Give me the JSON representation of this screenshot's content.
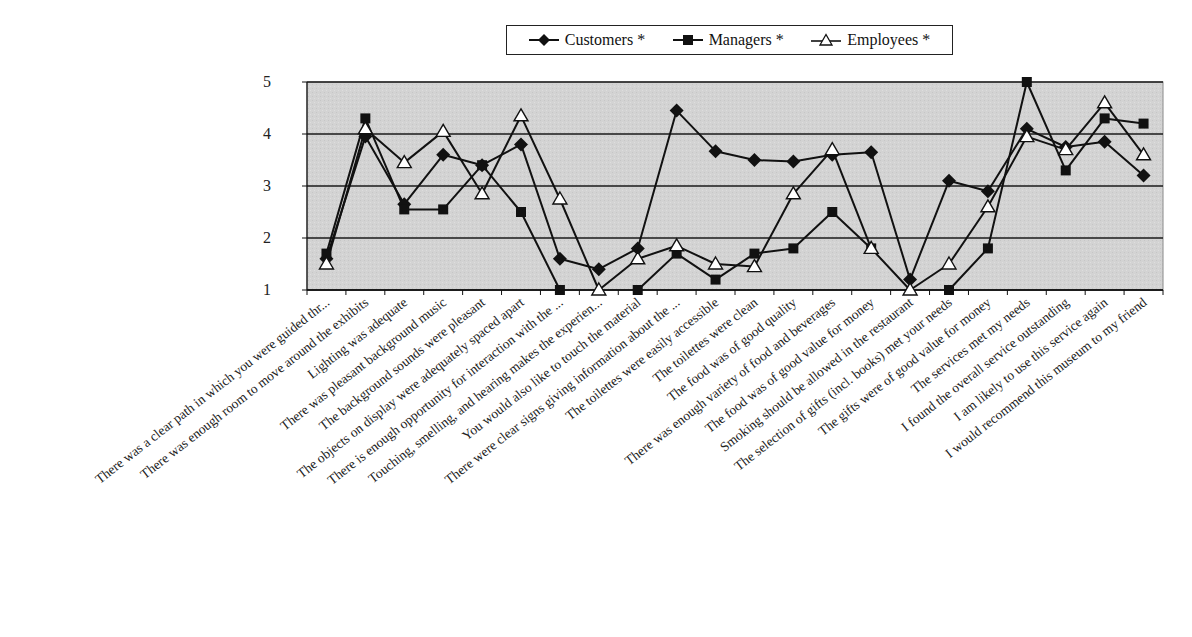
{
  "chart_data": {
    "type": "line",
    "title": "",
    "xlabel": "",
    "ylabel": "",
    "ylim": [
      1,
      5
    ],
    "yticks": [
      1,
      2,
      3,
      4,
      5
    ],
    "grid": true,
    "legend_position": "top",
    "categories": [
      "There was a clear path in which you were guided thr...",
      "There was enough room to move around the exhibits",
      "Lighting was adequate",
      "There was pleasant background music",
      "The background sounds were pleasant",
      "The objects on display were adequately spaced apart",
      "There is enough opportunity for interaction with the ...",
      "Touching, smelling, and hearing makes the experien...",
      "You would also like to touch the material",
      "There were clear signs giving information about the ...",
      "The toilettes were easily accessible",
      "The toilettes were clean",
      "The food was of good quality",
      "There was enough variety of food and beverages",
      "The food was of good value for money",
      "Smoking should be allowed in the restaurant",
      "The selection of gifts (incl. books) met your needs",
      "The gifts were of good value for money",
      "The services met my needs",
      "I found the overall service outstanding",
      "I am likely to use this service again",
      "I would recommend this museum to my friend"
    ],
    "series": [
      {
        "name": "Customers *",
        "marker": "diamond",
        "values": [
          1.6,
          3.95,
          2.65,
          3.6,
          3.4,
          3.8,
          1.6,
          1.4,
          1.8,
          4.45,
          3.67,
          3.5,
          3.47,
          3.6,
          3.65,
          1.2,
          3.1,
          2.9,
          4.1,
          3.75,
          3.85,
          3.2
        ]
      },
      {
        "name": "Managers *",
        "marker": "square",
        "values": [
          1.7,
          4.3,
          2.55,
          2.55,
          3.4,
          2.5,
          1.0,
          null,
          1.0,
          1.7,
          1.2,
          1.7,
          1.8,
          2.5,
          1.8,
          null,
          1.0,
          1.8,
          5.0,
          3.3,
          4.3,
          4.2
        ]
      },
      {
        "name": "Employees *",
        "marker": "triangle",
        "values": [
          1.5,
          4.1,
          3.45,
          4.05,
          2.85,
          4.35,
          2.75,
          1.0,
          1.6,
          1.85,
          1.5,
          1.45,
          2.85,
          3.7,
          1.8,
          1.0,
          1.5,
          2.6,
          3.95,
          3.7,
          4.6,
          3.6
        ]
      }
    ]
  },
  "legend": {
    "items": [
      {
        "label": "Customers *",
        "marker": "diamond"
      },
      {
        "label": "Managers *",
        "marker": "square"
      },
      {
        "label": "Employees *",
        "marker": "triangle"
      }
    ]
  },
  "colors": {
    "plot_background": "#d4d4d4",
    "line": "#111111",
    "gridline": "#1a1a1a",
    "triangle_fill": "#ffffff"
  }
}
